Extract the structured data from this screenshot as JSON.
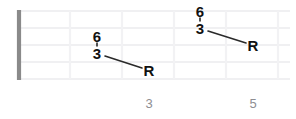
{
  "diagram": {
    "type": "guitar-fretboard-interval-diagram",
    "width": 296,
    "height": 119,
    "background_color": "#ffffff",
    "nut": {
      "label": "nut",
      "color": "#8a8a8a",
      "x": 19,
      "y_top": 10,
      "y_bottom": 80
    },
    "grid": {
      "string_line_color": "#f0f0f2",
      "fret_line_color": "#f2f2f4",
      "string_ys": [
        11,
        28,
        45,
        62,
        79
      ],
      "fret_xs": [
        19,
        70,
        122,
        174,
        226,
        278
      ],
      "string_count": 5,
      "fret_count": 5
    },
    "shapes": [
      {
        "name": "left-interval-shape",
        "notes": [
          {
            "label": "6",
            "x": 97,
            "y": 36
          },
          {
            "label": "3",
            "x": 97,
            "y": 53
          },
          {
            "label": "R",
            "x": 149,
            "y": 70
          }
        ],
        "connector": {
          "x1": 97,
          "y1": 43,
          "x2": 97,
          "y2": 46
        },
        "diagonal": {
          "x1": 105,
          "y1": 56,
          "x2": 142,
          "y2": 68
        }
      },
      {
        "name": "right-interval-shape",
        "notes": [
          {
            "label": "6",
            "x": 200,
            "y": 11
          },
          {
            "label": "3",
            "x": 200,
            "y": 28
          },
          {
            "label": "R",
            "x": 253,
            "y": 45
          }
        ],
        "connector": {
          "x1": 200,
          "y1": 18,
          "x2": 200,
          "y2": 21
        },
        "diagonal": {
          "x1": 208,
          "y1": 31,
          "x2": 246,
          "y2": 43
        }
      }
    ],
    "fret_numbers": [
      {
        "label": "3",
        "x": 149,
        "y": 103
      },
      {
        "label": "5",
        "x": 253,
        "y": 103
      }
    ],
    "note_label_color": "#111111",
    "fret_number_color": "#8e8e92"
  }
}
